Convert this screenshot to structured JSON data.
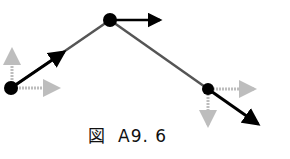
{
  "caption": {
    "figure_label": "図",
    "figure_number": "A9. 6"
  },
  "diagram": {
    "nodes": [
      {
        "id": "left",
        "x": 11,
        "y": 88
      },
      {
        "id": "top",
        "x": 110,
        "y": 20
      },
      {
        "id": "right",
        "x": 208,
        "y": 89
      }
    ],
    "links": [
      {
        "from": "left",
        "to": "top"
      },
      {
        "from": "top",
        "to": "right"
      }
    ],
    "colors": {
      "black": "#000000",
      "link": "#555555",
      "gray_arrow": "#bdbdbd"
    }
  }
}
